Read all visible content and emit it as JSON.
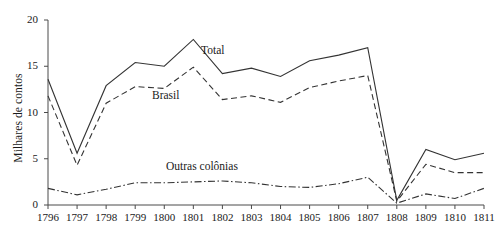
{
  "chart_data": {
    "type": "line",
    "title": "",
    "xlabel": "",
    "ylabel": "Milhares de contos",
    "categories": [
      "1796",
      "1797",
      "1798",
      "1799",
      "1800",
      "1801",
      "1802",
      "1803",
      "1804",
      "1805",
      "1806",
      "1807",
      "1808",
      "1809",
      "1810",
      "1811"
    ],
    "xlim": [
      1796,
      1811
    ],
    "ylim": [
      0,
      20
    ],
    "yticks": [
      0,
      5,
      10,
      15,
      20
    ],
    "ytick_labels": [
      "0",
      "5",
      "10",
      "15",
      "20"
    ],
    "grid": false,
    "legend": "inline-annotations",
    "series": [
      {
        "name": "Total",
        "style": "solid",
        "color": "#333333",
        "label_position": "inline",
        "values": [
          13.6,
          5.6,
          12.9,
          15.4,
          15.0,
          17.9,
          14.2,
          14.8,
          13.9,
          15.6,
          16.2,
          17.0,
          0.5,
          6.0,
          4.9,
          5.6
        ]
      },
      {
        "name": "Brasil",
        "style": "dashed",
        "color": "#333333",
        "label_position": "inline",
        "values": [
          11.8,
          4.3,
          11.0,
          12.8,
          12.6,
          14.9,
          11.4,
          11.8,
          11.1,
          12.7,
          13.4,
          14.0,
          0.4,
          4.4,
          3.5,
          3.5
        ]
      },
      {
        "name": "Outras colônias",
        "style": "dash-dot",
        "color": "#333333",
        "label_position": "inline",
        "values": [
          1.8,
          1.1,
          1.7,
          2.4,
          2.4,
          2.5,
          2.6,
          2.4,
          2.0,
          1.9,
          2.3,
          3.0,
          0.2,
          1.2,
          0.7,
          1.8
        ]
      }
    ]
  },
  "axes": {
    "y_title": "Milhares de contos"
  }
}
